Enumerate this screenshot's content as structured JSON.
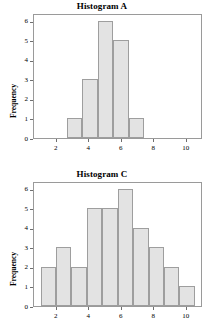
{
  "page": {
    "background": "#ffffff",
    "bar_fill": "#e3e3e3",
    "bar_stroke": "#9e9e9e",
    "frame_stroke": "#9a9a9a",
    "axis_text_color": "#000000"
  },
  "chart_data": [
    {
      "type": "bar",
      "title": "Histogram A",
      "xlabel": "",
      "ylabel": "Frequency",
      "grid": false,
      "legend": "none",
      "xlim": [
        0.6,
        11.0
      ],
      "ylim": [
        0,
        6.4
      ],
      "xticks": [
        2,
        4,
        6,
        8,
        10
      ],
      "xtick_labels": [
        "2",
        "4",
        "6",
        "8",
        "10"
      ],
      "yticks": [
        0,
        1,
        2,
        3,
        4,
        5,
        6
      ],
      "ytick_labels": [
        "0",
        "1",
        "2",
        "3",
        "4",
        "5",
        "6"
      ],
      "bin_edges": [
        2.6,
        3.56,
        4.52,
        5.48,
        6.44,
        7.4
      ],
      "categories": [
        "2.6-3.56",
        "3.56-4.52",
        "4.52-5.48",
        "5.48-6.44",
        "6.44-7.4"
      ],
      "values": [
        1,
        3,
        6,
        5,
        1
      ]
    },
    {
      "type": "bar",
      "title": "Histogram C",
      "xlabel": "",
      "ylabel": "Frequency",
      "grid": false,
      "legend": "none",
      "xlim": [
        0.6,
        11.0
      ],
      "ylim": [
        0,
        6.4
      ],
      "xticks": [
        2,
        4,
        6,
        8,
        10
      ],
      "xtick_labels": [
        "2",
        "4",
        "6",
        "8",
        "10"
      ],
      "yticks": [
        0,
        1,
        2,
        3,
        4,
        5,
        6
      ],
      "ytick_labels": [
        "0",
        "1",
        "2",
        "3",
        "4",
        "5",
        "6"
      ],
      "bin_edges": [
        1.0,
        1.95,
        2.9,
        3.85,
        4.8,
        5.75,
        6.7,
        7.65,
        8.6,
        9.55,
        10.5
      ],
      "categories": [
        "1-1.95",
        "1.95-2.9",
        "2.9-3.85",
        "3.85-4.8",
        "4.8-5.75",
        "5.75-6.7",
        "6.7-7.65",
        "7.65-8.6",
        "8.6-9.55",
        "9.55-10.5"
      ],
      "values": [
        2,
        3,
        2,
        5,
        5,
        6,
        4,
        3,
        2,
        1
      ]
    }
  ]
}
